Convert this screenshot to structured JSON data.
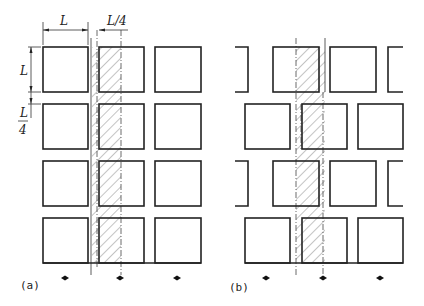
{
  "figure": {
    "panels": [
      {
        "id": "a",
        "caption": "(a)"
      },
      {
        "id": "b",
        "caption": "(b)"
      }
    ],
    "dimensions": {
      "width_label": "L",
      "gap_label": "L/4",
      "height_label": "L",
      "vgap_label_num": "L",
      "vgap_label_den": "4"
    }
  }
}
